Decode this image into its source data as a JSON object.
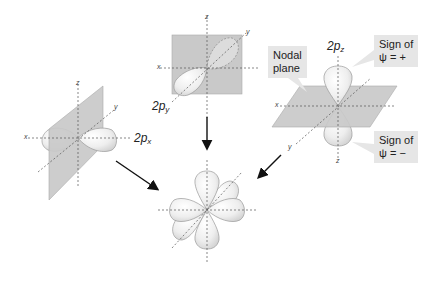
{
  "figure": {
    "orbitals": [
      {
        "id": "px",
        "label_main": "2p",
        "label_sub": "x",
        "axes": {
          "x": "x",
          "y": "y",
          "z": "z"
        }
      },
      {
        "id": "py",
        "label_main": "2p",
        "label_sub": "y",
        "axes": {
          "x": "x",
          "y": "y",
          "z": "z"
        }
      },
      {
        "id": "pz",
        "label_main": "2p",
        "label_sub": "z",
        "axes": {
          "x": "x",
          "y": "y",
          "z": "z"
        }
      }
    ],
    "callouts": {
      "nodal_plane_line1": "Nodal",
      "nodal_plane_line2": "plane",
      "sign_plus_line1": "Sign of",
      "sign_plus_line2": "ψ = +",
      "sign_minus_line1": "Sign of",
      "sign_minus_line2": "ψ = −"
    },
    "colors": {
      "plane": "#c9c9c9",
      "lobe_fill": "#f1f1f1",
      "lobe_stroke": "#9a9a9a",
      "axis": "#555555",
      "arrow": "#111111",
      "callout_bg": "#e6e6e6"
    }
  }
}
